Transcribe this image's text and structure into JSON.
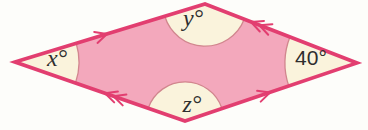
{
  "figure": {
    "shape": "parallelogram",
    "angle_labels": {
      "left": "x°",
      "top": "y°",
      "bottom": "z°",
      "right": "40°"
    },
    "parallel_marks": {
      "single_arrow_sides": "top-left side and bottom-right side",
      "double_arrow_sides": "top-right side and bottom-left side"
    },
    "colors": {
      "fill": "#f3a8bc",
      "outline": "#e23e70",
      "wedge_fill": "#faf3dc",
      "wedge_arc": "#d1868e",
      "text": "#2e2e2e",
      "background": "#fdfdfa"
    }
  }
}
